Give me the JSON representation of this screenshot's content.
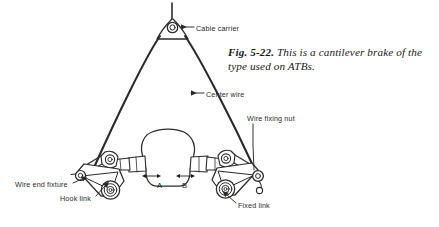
{
  "figure": {
    "caption_number": "Fig. 5-22.",
    "caption_text": "This is a cantilever brake of the type used on ATBs.",
    "background_color": "#ffffff",
    "ink_color": "#1a1a1a"
  },
  "callouts": {
    "cable_carrier": "Cable carrier",
    "center_wire": "Center wire",
    "wire_fixing_nut": "Wire fixing nut",
    "wire_end_fixture": "Wire end fixture",
    "hook_link": "Hook link",
    "fixed_link": "Fixed link"
  },
  "dimensions": {
    "gap_a": "A",
    "gap_b": "B"
  },
  "icons": {
    "cable_carrier": "cable-carrier-yoke-icon",
    "brake_arm_left": "left-brake-arm-icon",
    "brake_arm_right": "right-brake-arm-icon",
    "rim_tire": "rim-tire-profile-icon",
    "hook": "hook-icon"
  }
}
